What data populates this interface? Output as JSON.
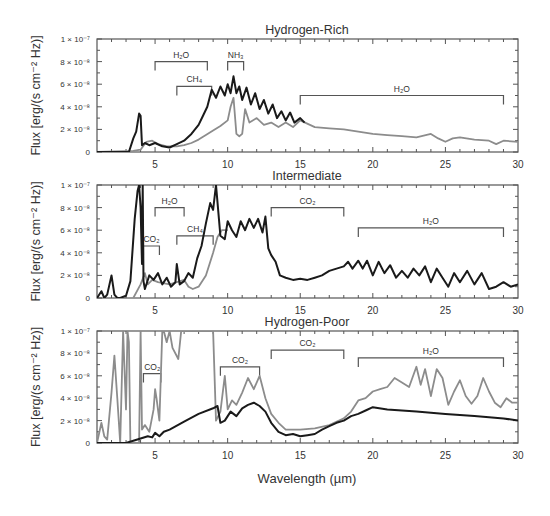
{
  "figure": {
    "xlabel": "Wavelength (µm)",
    "ylabel": "Flux [erg/(s cm⁻² Hz)]",
    "x_ticks": [
      5,
      10,
      15,
      20,
      25,
      30
    ],
    "y_tick_labels": [
      "0",
      "2 × 10⁻⁸",
      "4 × 10⁻⁸",
      "6 × 10⁻⁸",
      "8 × 10⁻⁸",
      "1 × 10⁻⁷"
    ],
    "colors": {
      "black_series": "#1a1a1a",
      "gray_series": "#8c8c8c",
      "bracket": "#555555"
    }
  },
  "chart_data": [
    {
      "type": "line",
      "title": "Hydrogen-Rich",
      "xlabel": "Wavelength (µm)",
      "ylabel": "Flux [erg/(s cm⁻² Hz)]",
      "xlim": [
        1,
        30
      ],
      "ylim": [
        0,
        1e-07
      ],
      "y_unit": "1e-8",
      "series": [
        {
          "name": "black",
          "color": "#1a1a1a",
          "x": [
            1,
            3.2,
            3.5,
            3.7,
            3.9,
            4.0,
            4.1,
            4.3,
            4.6,
            5.0,
            5.5,
            6.0,
            6.5,
            7.0,
            7.5,
            8.0,
            8.3,
            8.6,
            8.9,
            9.2,
            9.5,
            9.8,
            10.0,
            10.2,
            10.4,
            10.6,
            10.8,
            11.0,
            11.3,
            11.6,
            11.9,
            12.2,
            12.5,
            12.8,
            13.1,
            13.4,
            13.7,
            14.0,
            14.3,
            14.6,
            15.0,
            15.3
          ],
          "y": [
            0,
            0,
            1.2,
            1.8,
            3.4,
            3.2,
            0.6,
            0.8,
            0.6,
            0.8,
            0.5,
            0.4,
            0.7,
            1.0,
            1.6,
            2.4,
            3.2,
            4.0,
            5.5,
            4.8,
            5.8,
            5.0,
            6.0,
            5.2,
            6.7,
            5.2,
            5.8,
            4.6,
            5.7,
            4.2,
            5.2,
            3.8,
            4.6,
            3.4,
            4.2,
            3.0,
            3.6,
            2.8,
            3.5,
            2.6,
            3.0,
            2.6
          ]
        },
        {
          "name": "gray",
          "color": "#8c8c8c",
          "x": [
            1,
            3.5,
            4.0,
            4.4,
            4.8,
            5.2,
            5.8,
            6.5,
            7.0,
            7.5,
            8.0,
            8.5,
            9.0,
            9.5,
            10.0,
            10.2,
            10.4,
            10.6,
            10.8,
            11.0,
            11.2,
            11.5,
            12.0,
            12.5,
            13.0,
            13.5,
            14.0,
            14.5,
            15.0,
            16.0,
            17.0,
            18.0,
            19.0,
            20.0,
            21.0,
            22.0,
            23.0,
            24.0,
            24.5,
            25.0,
            25.5,
            26.0,
            27.0,
            28.0,
            28.5,
            29.0,
            30.0
          ],
          "y": [
            0,
            0.1,
            0.2,
            0.9,
            1.0,
            0.7,
            0.5,
            0.5,
            0.6,
            0.8,
            1.1,
            1.5,
            1.9,
            2.3,
            2.8,
            4.0,
            4.8,
            1.6,
            1.4,
            1.6,
            3.8,
            2.6,
            3.0,
            2.4,
            2.6,
            2.2,
            2.6,
            2.2,
            2.8,
            2.2,
            2.1,
            2.0,
            1.8,
            1.6,
            1.5,
            1.4,
            1.3,
            1.6,
            1.2,
            0.9,
            1.2,
            1.3,
            1.1,
            1.0,
            0.7,
            1.0,
            0.9
          ]
        }
      ],
      "annotations": [
        {
          "label": "H₂O",
          "x0": 5.0,
          "x1": 8.6,
          "y": 8.0
        },
        {
          "label": "NH₃",
          "x0": 10.0,
          "x1": 11.1,
          "y": 8.0
        },
        {
          "label": "CH₄",
          "x0": 6.5,
          "x1": 8.9,
          "y": 5.8
        },
        {
          "label": "H₂O",
          "x0": 15.0,
          "x1": 29.0,
          "y": 5.0
        }
      ]
    },
    {
      "type": "line",
      "title": "Intermediate",
      "xlabel": "Wavelength (µm)",
      "ylabel": "Flux [erg/(s cm⁻² Hz)]",
      "xlim": [
        1,
        30
      ],
      "ylim": [
        0,
        1e-07
      ],
      "y_unit": "1e-8",
      "series": [
        {
          "name": "black",
          "color": "#1a1a1a",
          "x": [
            1,
            1.3,
            1.5,
            1.7,
            2.0,
            2.2,
            2.4,
            2.6,
            3.0,
            3.3,
            3.6,
            3.8,
            3.9,
            4.0,
            4.1,
            4.15,
            4.2,
            4.3,
            4.6,
            4.9,
            5.2,
            5.5,
            5.8,
            6.1,
            6.4,
            6.5,
            6.7,
            7.0,
            7.3,
            7.6,
            7.9,
            8.2,
            8.5,
            8.8,
            9.0,
            9.2,
            9.5,
            9.8,
            10.0,
            10.3,
            10.6,
            10.9,
            11.2,
            11.5,
            11.8,
            12.1,
            12.4,
            12.6,
            12.8,
            13.0,
            13.3,
            13.6,
            14.0,
            14.5,
            15.0,
            15.5,
            16.0,
            16.5,
            17.0,
            17.5,
            18.0,
            18.3,
            18.6,
            19.0,
            19.3,
            19.6,
            20.0,
            20.4,
            20.8,
            21.2,
            21.6,
            22.0,
            22.4,
            22.8,
            23.2,
            23.6,
            24.0,
            24.4,
            24.8,
            25.2,
            25.6,
            26.0,
            26.5,
            27.0,
            27.5,
            28.0,
            28.5,
            29.0,
            29.5,
            30.0
          ],
          "y": [
            0,
            0.6,
            0,
            0.3,
            2.0,
            0.3,
            0,
            0,
            0.2,
            1.5,
            7.0,
            9.5,
            10.0,
            8.0,
            3.0,
            10.0,
            1.5,
            0.8,
            2.0,
            1.6,
            2.2,
            1.2,
            1.8,
            1.0,
            1.4,
            3.0,
            1.2,
            1.5,
            2.2,
            1.8,
            3.5,
            4.6,
            6.6,
            8.4,
            7.8,
            10.0,
            5.5,
            5.2,
            6.8,
            6.0,
            5.4,
            6.8,
            6.0,
            7.0,
            6.2,
            7.0,
            5.8,
            7.2,
            4.4,
            3.8,
            3.2,
            2.0,
            1.8,
            1.6,
            1.7,
            1.6,
            1.8,
            2.0,
            2.4,
            2.6,
            2.8,
            3.2,
            2.6,
            3.3,
            2.6,
            3.3,
            2.0,
            3.2,
            2.2,
            2.9,
            1.8,
            2.4,
            1.8,
            2.6,
            2.0,
            2.8,
            1.4,
            2.6,
            1.8,
            1.0,
            2.2,
            1.4,
            2.4,
            1.2,
            2.2,
            0.8,
            1.0,
            1.4,
            1.0,
            1.2
          ]
        },
        {
          "name": "gray",
          "color": "#8c8c8c",
          "x": [
            3.5,
            4.0,
            4.3,
            4.5,
            4.8,
            5.2,
            6.0,
            7.0,
            7.3,
            7.6,
            8.0,
            8.5,
            9.0,
            9.3,
            9.6,
            10.0
          ],
          "y": [
            0,
            1.2,
            2.2,
            1.2,
            1.6,
            1.4,
            1.2,
            1.6,
            1.0,
            0.8,
            1.0,
            2.0,
            4.0,
            5.4,
            6.0,
            6.0
          ]
        }
      ],
      "annotations": [
        {
          "label": "H₂O",
          "x0": 5.0,
          "x1": 7.0,
          "y": 8.0
        },
        {
          "label": "CO₂",
          "x0": 4.2,
          "x1": 5.3,
          "y": 4.6
        },
        {
          "label": "CH₄",
          "x0": 6.5,
          "x1": 9.0,
          "y": 5.5
        },
        {
          "label": "CO₂",
          "x0": 13.0,
          "x1": 18.0,
          "y": 8.0
        },
        {
          "label": "H₂O",
          "x0": 19.0,
          "x1": 29.0,
          "y": 6.2
        }
      ]
    },
    {
      "type": "line",
      "title": "Hydrogen-Poor",
      "xlabel": "Wavelength (µm)",
      "ylabel": "Flux [erg/(s cm⁻² Hz)]",
      "xlim": [
        1,
        30
      ],
      "ylim": [
        0,
        1e-07
      ],
      "y_unit": "1e-8",
      "series": [
        {
          "name": "black",
          "color": "#1a1a1a",
          "x": [
            1,
            3.0,
            3.5,
            4.0,
            4.5,
            4.8,
            5.0,
            5.3,
            5.6,
            6.0,
            7.0,
            8.0,
            9.0,
            9.3,
            9.5,
            9.8,
            10.2,
            10.6,
            11.0,
            11.4,
            11.8,
            12.2,
            12.6,
            13.0,
            13.5,
            14.0,
            14.5,
            15.0,
            15.5,
            16.0,
            16.5,
            17.0,
            17.5,
            18.0,
            18.5,
            19.0,
            19.5,
            20.0,
            21.0,
            22.0,
            23.0,
            24.0,
            25.0,
            26.0,
            27.0,
            28.0,
            29.0,
            30.0
          ],
          "y": [
            0,
            0,
            0.2,
            0.4,
            0.6,
            0.5,
            0.9,
            0.6,
            1.0,
            1.2,
            1.9,
            2.6,
            3.1,
            3.3,
            1.8,
            2.0,
            2.8,
            2.4,
            3.1,
            3.4,
            3.6,
            3.3,
            2.8,
            1.8,
            1.0,
            0.7,
            0.8,
            0.6,
            0.7,
            0.8,
            1.2,
            1.5,
            1.8,
            2.0,
            2.4,
            2.6,
            2.9,
            3.2,
            3.0,
            2.9,
            2.8,
            2.7,
            2.6,
            2.5,
            2.4,
            2.3,
            2.2,
            2.0
          ]
        },
        {
          "name": "gray",
          "color": "#8c8c8c",
          "x": [
            1,
            1.3,
            1.5,
            1.7,
            2.0,
            2.2,
            2.4,
            2.6,
            2.8,
            3.0,
            3.1,
            3.2,
            3.3,
            3.9,
            4.0,
            4.1,
            4.3,
            4.6,
            4.9,
            5.0,
            5.1,
            5.3,
            5.5,
            5.6,
            5.8,
            6.0,
            6.2,
            6.6,
            6.8,
            7.0,
            9.0,
            9.2,
            9.5,
            9.8,
            10.0,
            10.3,
            10.6,
            11.0,
            11.4,
            11.8,
            12.2,
            12.6,
            13.0,
            13.5,
            14.0,
            15.0,
            16.0,
            17.0,
            18.0,
            18.5,
            19.0,
            19.5,
            20.0,
            20.5,
            21.0,
            21.5,
            22.0,
            22.5,
            23.0,
            23.3,
            23.6,
            24.0,
            24.4,
            24.8,
            25.2,
            25.6,
            26.0,
            26.4,
            26.8,
            27.2,
            27.6,
            28.0,
            28.4,
            28.8,
            29.2,
            29.6,
            30.0
          ],
          "y": [
            0,
            1.8,
            0.6,
            0.3,
            4.5,
            7.8,
            4.0,
            0,
            10.0,
            3.0,
            10.0,
            9.0,
            0,
            0,
            10.0,
            1.2,
            1.6,
            1.0,
            3.0,
            4.8,
            4.0,
            2.0,
            10.0,
            10.0,
            9.0,
            10.0,
            8.5,
            7.5,
            10.0,
            10.0,
            10.0,
            2.0,
            2.8,
            6.0,
            3.0,
            3.8,
            3.4,
            4.5,
            5.8,
            4.8,
            6.0,
            4.0,
            2.6,
            1.8,
            1.2,
            1.2,
            1.3,
            1.6,
            2.2,
            2.8,
            3.8,
            4.0,
            4.6,
            4.8,
            5.0,
            5.8,
            5.4,
            5.0,
            6.8,
            5.2,
            6.6,
            4.2,
            6.6,
            5.8,
            3.4,
            4.6,
            5.6,
            4.2,
            3.5,
            4.2,
            5.8,
            4.6,
            3.6,
            3.2,
            4.0,
            3.6,
            3.6
          ]
        }
      ],
      "annotations": [
        {
          "label": "CO₂",
          "x0": 4.2,
          "x1": 5.4,
          "y": 6.2
        },
        {
          "label": "CO₂",
          "x0": 9.5,
          "x1": 12.2,
          "y": 6.8
        },
        {
          "label": "CO₂",
          "x0": 13.0,
          "x1": 18.0,
          "y": 8.3
        },
        {
          "label": "H₂O",
          "x0": 19.0,
          "x1": 29.0,
          "y": 7.6
        }
      ]
    }
  ]
}
